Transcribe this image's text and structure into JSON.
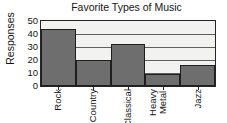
{
  "chart_data": {
    "type": "bar",
    "title": "Favorite Types of Music",
    "xlabel": "",
    "ylabel": "Responses",
    "categories": [
      "Rock",
      "Country",
      "Classical",
      "Heavy\nMetal",
      "Jazz"
    ],
    "values": [
      44,
      20,
      32,
      9,
      16
    ],
    "ylim": [
      0,
      50
    ],
    "yticks": [
      0,
      10,
      20,
      30,
      40,
      50
    ],
    "ytick_labels": [
      "0",
      "10",
      "20",
      "30",
      "40",
      "50"
    ],
    "grid": "horizontal",
    "legend": "none",
    "bar_color": "#6e6e6e",
    "bar_edge_color": "#1e1e1e",
    "plot_background": "#f2f2f0",
    "axis_color": "#242424",
    "gridline_color": "#5f5f5f",
    "bar_gap": 0
  }
}
